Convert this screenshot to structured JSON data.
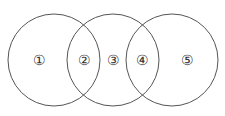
{
  "diagram": {
    "type": "venn",
    "stroke_color": "#555555",
    "circles": [
      {
        "id": "left",
        "cx": 54,
        "cy": 60,
        "r": 46
      },
      {
        "id": "middle",
        "cx": 113,
        "cy": 60,
        "r": 46
      },
      {
        "id": "right",
        "cx": 172,
        "cy": 60,
        "r": 46
      }
    ],
    "regions": [
      {
        "label": "①",
        "x": 39,
        "y": 60
      },
      {
        "label": "②",
        "x": 84,
        "y": 60
      },
      {
        "label": "③",
        "x": 113,
        "y": 60
      },
      {
        "label": "④",
        "x": 142,
        "y": 60
      },
      {
        "label": "⑤",
        "x": 187,
        "y": 60
      }
    ]
  }
}
